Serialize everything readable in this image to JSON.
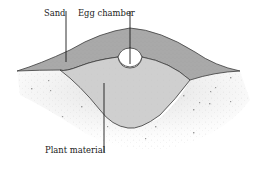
{
  "diagram": {
    "type": "cross-section",
    "labels": {
      "sand": "Sand",
      "egg_chamber": "Egg chamber",
      "plant_material": "Plant material"
    },
    "colors": {
      "sand_fill": "#a9a9a9",
      "plant_fill": "#cfcfcf",
      "chamber_fill": "#ffffff",
      "outline": "#3a3a3a",
      "ground_speckle": "#8a8a8a",
      "background": "#ffffff"
    }
  }
}
